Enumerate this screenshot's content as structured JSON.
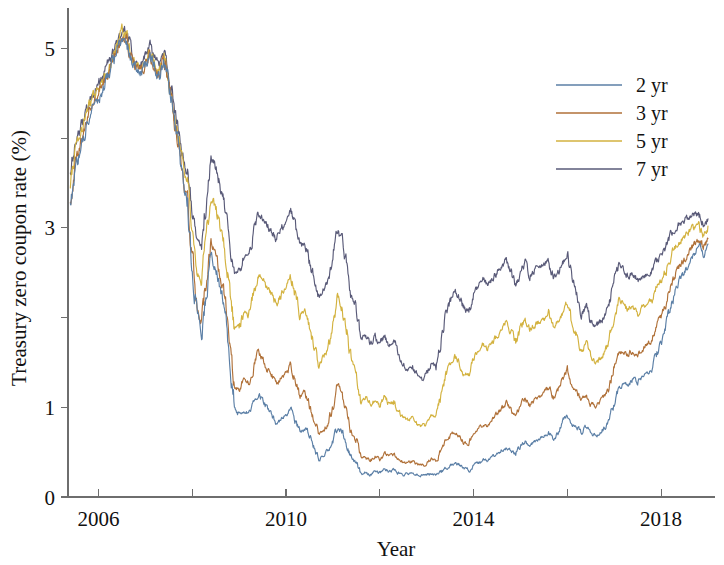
{
  "chart_data": {
    "type": "line",
    "title": "",
    "xlabel": "Year",
    "ylabel": "Treasury zero coupon rate (%)",
    "xlim": [
      2005.35,
      2019.15
    ],
    "ylim": [
      0,
      5.45
    ],
    "xticks": [
      2006,
      2008,
      2010,
      2012,
      2014,
      2016,
      2018
    ],
    "xtick_labels": [
      "2006",
      "",
      "2010",
      "",
      "2014",
      "",
      "2018"
    ],
    "yticks": [
      0,
      1,
      2,
      3,
      4,
      5
    ],
    "ytick_labels": [
      "0",
      "1",
      "2",
      "3",
      "4",
      "5"
    ],
    "ytick_labels_shown": [
      "0",
      "1",
      "",
      "3",
      "",
      "5"
    ],
    "grid": false,
    "legend_position": "upper right",
    "legend_entries": [
      "2 yr",
      "3 yr",
      "5 yr",
      "7 yr"
    ],
    "colors": {
      "2 yr": "#5b7fa6",
      "3 yr": "#b07139",
      "5 yr": "#d3b23f",
      "7 yr": "#595a78"
    },
    "x": [
      2005.4,
      2005.5,
      2005.6,
      2005.7,
      2005.8,
      2005.9,
      2006.0,
      2006.1,
      2006.2,
      2006.3,
      2006.4,
      2006.5,
      2006.6,
      2006.7,
      2006.8,
      2006.9,
      2007.0,
      2007.1,
      2007.2,
      2007.3,
      2007.4,
      2007.5,
      2007.6,
      2007.7,
      2007.8,
      2007.9,
      2008.0,
      2008.1,
      2008.2,
      2008.3,
      2008.4,
      2008.5,
      2008.6,
      2008.7,
      2008.8,
      2008.9,
      2009.0,
      2009.1,
      2009.2,
      2009.3,
      2009.4,
      2009.5,
      2009.6,
      2009.7,
      2009.8,
      2009.9,
      2010.0,
      2010.1,
      2010.2,
      2010.3,
      2010.4,
      2010.5,
      2010.6,
      2010.7,
      2010.8,
      2010.9,
      2011.0,
      2011.1,
      2011.2,
      2011.3,
      2011.4,
      2011.5,
      2011.6,
      2011.7,
      2011.8,
      2011.9,
      2012.0,
      2012.1,
      2012.2,
      2012.3,
      2012.4,
      2012.5,
      2012.6,
      2012.7,
      2012.8,
      2012.9,
      2013.0,
      2013.1,
      2013.2,
      2013.3,
      2013.4,
      2013.5,
      2013.6,
      2013.7,
      2013.8,
      2013.9,
      2014.0,
      2014.1,
      2014.2,
      2014.3,
      2014.4,
      2014.5,
      2014.6,
      2014.7,
      2014.8,
      2014.9,
      2015.0,
      2015.1,
      2015.2,
      2015.3,
      2015.4,
      2015.5,
      2015.6,
      2015.7,
      2015.8,
      2015.9,
      2016.0,
      2016.1,
      2016.2,
      2016.3,
      2016.4,
      2016.5,
      2016.6,
      2016.7,
      2016.8,
      2016.9,
      2017.0,
      2017.1,
      2017.2,
      2017.3,
      2017.4,
      2017.5,
      2017.6,
      2017.7,
      2017.8,
      2017.9,
      2018.0,
      2018.1,
      2018.2,
      2018.3,
      2018.4,
      2018.5,
      2018.6,
      2018.7,
      2018.8,
      2018.9,
      2019.0
    ],
    "series": [
      {
        "name": "2 yr",
        "color": "#5b7fa6",
        "values": [
          3.18,
          3.62,
          3.82,
          4.05,
          4.22,
          4.38,
          4.42,
          4.55,
          4.68,
          4.82,
          4.95,
          5.12,
          5.05,
          4.88,
          4.76,
          4.72,
          4.82,
          4.92,
          4.78,
          4.68,
          4.85,
          4.62,
          4.28,
          3.92,
          3.55,
          3.28,
          2.62,
          2.05,
          1.82,
          2.28,
          2.68,
          2.55,
          2.32,
          2.05,
          1.55,
          1.02,
          0.92,
          0.98,
          0.92,
          1.02,
          1.15,
          1.08,
          0.98,
          0.92,
          0.82,
          0.88,
          0.92,
          0.98,
          0.85,
          0.72,
          0.78,
          0.68,
          0.55,
          0.42,
          0.45,
          0.52,
          0.62,
          0.78,
          0.72,
          0.58,
          0.42,
          0.38,
          0.25,
          0.28,
          0.25,
          0.28,
          0.27,
          0.32,
          0.28,
          0.3,
          0.27,
          0.25,
          0.26,
          0.28,
          0.25,
          0.24,
          0.25,
          0.26,
          0.24,
          0.28,
          0.32,
          0.35,
          0.38,
          0.35,
          0.32,
          0.3,
          0.36,
          0.38,
          0.42,
          0.4,
          0.45,
          0.48,
          0.52,
          0.55,
          0.52,
          0.48,
          0.58,
          0.62,
          0.58,
          0.62,
          0.65,
          0.68,
          0.72,
          0.65,
          0.72,
          0.85,
          0.92,
          0.82,
          0.78,
          0.72,
          0.78,
          0.72,
          0.68,
          0.72,
          0.78,
          0.85,
          1.05,
          1.22,
          1.28,
          1.25,
          1.32,
          1.28,
          1.35,
          1.38,
          1.42,
          1.58,
          1.72,
          1.88,
          2.12,
          2.28,
          2.42,
          2.52,
          2.62,
          2.72,
          2.8,
          2.72,
          2.82
        ]
      },
      {
        "name": "3 yr",
        "color": "#b07139",
        "values": [
          3.32,
          3.72,
          3.9,
          4.12,
          4.28,
          4.42,
          4.48,
          4.6,
          4.72,
          4.85,
          4.98,
          5.15,
          5.08,
          4.9,
          4.78,
          4.74,
          4.84,
          4.94,
          4.8,
          4.7,
          4.88,
          4.62,
          4.28,
          3.92,
          3.58,
          3.3,
          2.7,
          2.15,
          1.95,
          2.42,
          2.85,
          2.72,
          2.48,
          2.2,
          1.72,
          1.22,
          1.2,
          1.32,
          1.28,
          1.42,
          1.62,
          1.55,
          1.42,
          1.35,
          1.25,
          1.32,
          1.38,
          1.48,
          1.3,
          1.12,
          1.18,
          1.02,
          0.85,
          0.7,
          0.75,
          0.82,
          1.02,
          1.25,
          1.15,
          0.92,
          0.68,
          0.62,
          0.42,
          0.45,
          0.4,
          0.45,
          0.42,
          0.5,
          0.45,
          0.48,
          0.42,
          0.38,
          0.38,
          0.4,
          0.36,
          0.35,
          0.38,
          0.42,
          0.4,
          0.52,
          0.62,
          0.68,
          0.72,
          0.66,
          0.6,
          0.58,
          0.7,
          0.75,
          0.82,
          0.78,
          0.85,
          0.92,
          0.98,
          1.05,
          0.98,
          0.88,
          1.02,
          1.1,
          1.02,
          1.08,
          1.12,
          1.15,
          1.22,
          1.1,
          1.18,
          1.32,
          1.42,
          1.25,
          1.18,
          1.08,
          1.15,
          1.05,
          1.0,
          1.05,
          1.12,
          1.22,
          1.45,
          1.6,
          1.62,
          1.58,
          1.65,
          1.58,
          1.65,
          1.7,
          1.75,
          1.9,
          2.02,
          2.15,
          2.35,
          2.48,
          2.58,
          2.65,
          2.72,
          2.8,
          2.86,
          2.78,
          2.88
        ]
      },
      {
        "name": "5 yr",
        "color": "#d3b23f",
        "values": [
          3.48,
          3.85,
          4.0,
          4.2,
          4.35,
          4.48,
          4.55,
          4.66,
          4.78,
          4.9,
          5.02,
          5.2,
          5.12,
          4.94,
          4.82,
          4.78,
          4.88,
          4.98,
          4.84,
          4.74,
          4.92,
          4.66,
          4.34,
          4.0,
          3.7,
          3.45,
          2.95,
          2.52,
          2.4,
          2.92,
          3.35,
          3.22,
          3.0,
          2.75,
          2.32,
          1.88,
          1.9,
          2.05,
          2.02,
          2.25,
          2.48,
          2.42,
          2.32,
          2.25,
          2.15,
          2.25,
          2.35,
          2.45,
          2.25,
          2.02,
          2.08,
          1.88,
          1.68,
          1.48,
          1.55,
          1.65,
          1.92,
          2.22,
          2.1,
          1.82,
          1.48,
          1.38,
          1.05,
          1.1,
          1.02,
          1.08,
          1.0,
          1.12,
          1.02,
          1.06,
          0.95,
          0.88,
          0.85,
          0.88,
          0.8,
          0.78,
          0.82,
          0.9,
          0.88,
          1.1,
          1.35,
          1.48,
          1.58,
          1.48,
          1.38,
          1.35,
          1.55,
          1.62,
          1.7,
          1.65,
          1.72,
          1.8,
          1.88,
          1.96,
          1.85,
          1.7,
          1.88,
          1.98,
          1.85,
          1.92,
          1.96,
          1.98,
          2.05,
          1.88,
          1.95,
          2.08,
          2.18,
          1.92,
          1.8,
          1.62,
          1.7,
          1.55,
          1.48,
          1.55,
          1.62,
          1.75,
          2.02,
          2.18,
          2.15,
          2.08,
          2.15,
          2.05,
          2.12,
          2.15,
          2.18,
          2.32,
          2.42,
          2.52,
          2.68,
          2.78,
          2.85,
          2.9,
          2.95,
          3.0,
          3.02,
          2.92,
          3.02
        ]
      },
      {
        "name": "7 yr",
        "color": "#595a78",
        "values": [
          3.58,
          3.95,
          4.08,
          4.26,
          4.4,
          4.52,
          4.6,
          4.7,
          4.82,
          4.94,
          5.06,
          5.24,
          5.16,
          4.98,
          4.86,
          4.82,
          4.92,
          5.02,
          4.88,
          4.78,
          4.96,
          4.72,
          4.42,
          4.12,
          3.85,
          3.62,
          3.2,
          2.88,
          2.82,
          3.35,
          3.78,
          3.65,
          3.45,
          3.22,
          2.85,
          2.48,
          2.52,
          2.68,
          2.68,
          2.92,
          3.15,
          3.1,
          3.02,
          2.95,
          2.88,
          2.98,
          3.08,
          3.18,
          3.0,
          2.78,
          2.84,
          2.62,
          2.42,
          2.22,
          2.3,
          2.42,
          2.68,
          2.98,
          2.86,
          2.58,
          2.22,
          2.12,
          1.75,
          1.8,
          1.7,
          1.78,
          1.68,
          1.82,
          1.7,
          1.74,
          1.6,
          1.48,
          1.42,
          1.45,
          1.35,
          1.32,
          1.38,
          1.48,
          1.45,
          1.72,
          2.02,
          2.18,
          2.32,
          2.22,
          2.1,
          2.06,
          2.28,
          2.35,
          2.42,
          2.36,
          2.42,
          2.5,
          2.58,
          2.65,
          2.52,
          2.35,
          2.52,
          2.62,
          2.48,
          2.55,
          2.58,
          2.58,
          2.65,
          2.45,
          2.5,
          2.62,
          2.72,
          2.42,
          2.28,
          2.05,
          2.12,
          1.95,
          1.88,
          1.95,
          2.02,
          2.15,
          2.42,
          2.58,
          2.52,
          2.45,
          2.5,
          2.4,
          2.45,
          2.48,
          2.5,
          2.62,
          2.7,
          2.78,
          2.92,
          3.0,
          3.05,
          3.08,
          3.12,
          3.15,
          3.15,
          3.02,
          3.1
        ]
      }
    ]
  }
}
